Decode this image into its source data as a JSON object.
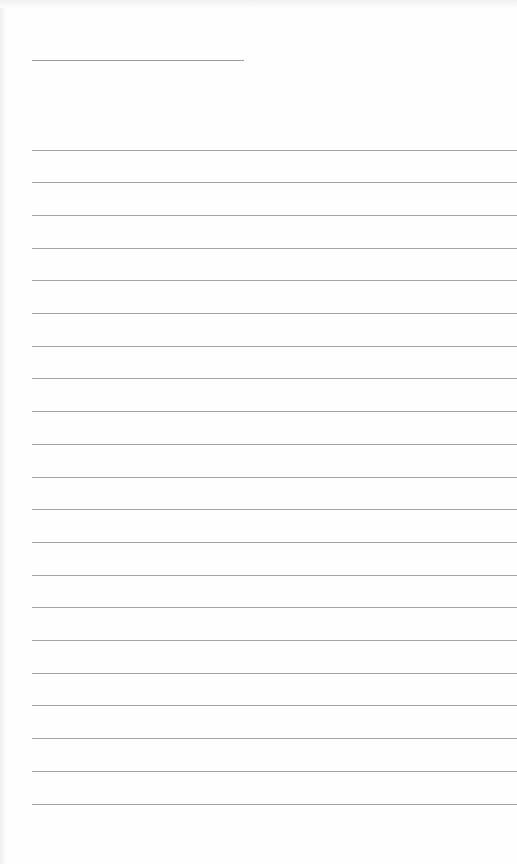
{
  "page": {
    "type": "blank lined paper",
    "header_line": {
      "top": 60,
      "left": 32,
      "width": 212
    },
    "rules": {
      "count": 21,
      "first_top": 149.5,
      "spacing": 32.7,
      "left": 32,
      "color": "#a3a3a3"
    }
  }
}
